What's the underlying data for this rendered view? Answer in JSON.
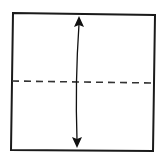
{
  "diagram": {
    "type": "origami-fold-step",
    "colors": {
      "background": "#ffffff",
      "paper_outline": "#1a1a1a",
      "fold_line": "#333333",
      "arrow": "#111111"
    },
    "paper": {
      "shape": "square",
      "corners": [
        [
          13,
          13
        ],
        [
          155,
          15
        ],
        [
          153,
          151
        ],
        [
          11,
          150
        ]
      ]
    },
    "fold_line": {
      "style": "dashed",
      "kind": "valley-fold",
      "from": [
        12,
        81
      ],
      "to": [
        154,
        83
      ]
    },
    "arrow": {
      "style": "double-headed",
      "meaning": "fold and unfold",
      "top_tip": [
        79,
        16
      ],
      "bottom_tip": [
        77,
        148
      ]
    }
  }
}
